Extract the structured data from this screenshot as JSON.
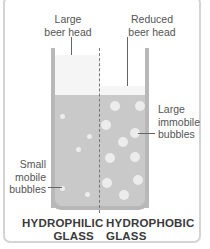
{
  "labels": {
    "large_beer_head": "Large\nbeer head",
    "large_beer_head_l1": "Large",
    "large_beer_head_l2": "beer head",
    "reduced_beer_head_l1": "Reduced",
    "reduced_beer_head_l2": "beer head",
    "large_immobile_l1": "Large",
    "large_immobile_l2": "immobile",
    "large_immobile_l3": "bubbles",
    "small_mobile_l1": "Small",
    "small_mobile_l2": "mobile",
    "small_mobile_l3": "bubbles"
  },
  "titles": {
    "left_l1": "HYDROPHILIC",
    "left_l2": "GLASS",
    "right_l1": "HYDROPHOBIC",
    "right_l2": "GLASS"
  },
  "colors": {
    "beer": "#c9c9c9",
    "foam": "#f5f5f5",
    "bubble": "#ececec",
    "glass": "#b8b8b8",
    "frame": "#d4d4d4"
  }
}
